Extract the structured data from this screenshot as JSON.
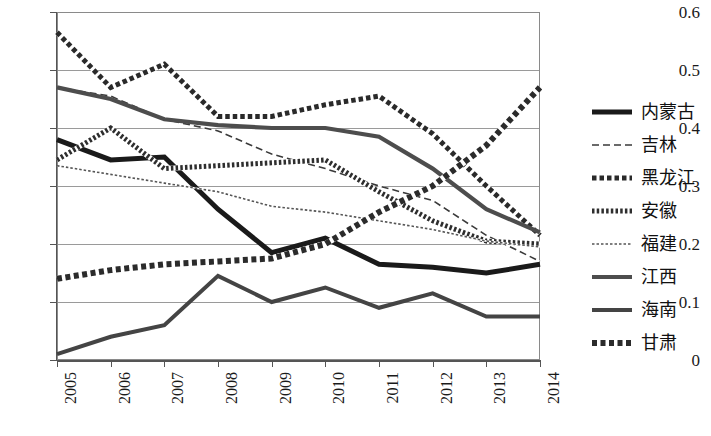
{
  "chart_data": {
    "type": "line",
    "title": "",
    "xlabel": "",
    "ylabel": "",
    "x": [
      "2005",
      "2006",
      "2007",
      "2008",
      "2009",
      "2010",
      "2011",
      "2012",
      "2013",
      "2014"
    ],
    "categories": [
      "2005",
      "2006",
      "2007",
      "2008",
      "2009",
      "2010",
      "2011",
      "2012",
      "2013",
      "2014"
    ],
    "xlim": [
      2005,
      2014
    ],
    "ylim": [
      0,
      0.6
    ],
    "yticks": [
      "0",
      "0.1",
      "0.2",
      "0.3",
      "0.4",
      "0.5",
      "0.6"
    ],
    "ytick_values": [
      0,
      0.1,
      0.2,
      0.3,
      0.4,
      0.5,
      0.6
    ],
    "grid": "horizontal",
    "legend_position": "right",
    "series": [
      {
        "name": "内蒙古",
        "style": "thick-solid-black",
        "color": "#1a1a1a",
        "values": [
          0.38,
          0.345,
          0.35,
          0.26,
          0.185,
          0.21,
          0.165,
          0.16,
          0.15,
          0.165
        ]
      },
      {
        "name": "吉林",
        "style": "thin-dashed",
        "color": "#3a3a3a",
        "values": [
          0.47,
          0.455,
          0.415,
          0.395,
          0.355,
          0.33,
          0.3,
          0.275,
          0.215,
          0.17
        ]
      },
      {
        "name": "黑龙江",
        "style": "thick-dotted",
        "color": "#2a2a2a",
        "values": [
          0.565,
          0.47,
          0.51,
          0.42,
          0.42,
          0.44,
          0.455,
          0.39,
          0.3,
          0.215
        ]
      },
      {
        "name": "安徽",
        "style": "thick-zigzag-dash",
        "color": "#2e2e2e",
        "values": [
          0.345,
          0.4,
          0.33,
          0.335,
          0.34,
          0.345,
          0.29,
          0.24,
          0.205,
          0.2
        ]
      },
      {
        "name": "福建",
        "style": "thin-zigzag",
        "color": "#555555",
        "values": [
          0.335,
          0.32,
          0.305,
          0.29,
          0.265,
          0.255,
          0.24,
          0.225,
          0.205,
          0.195
        ]
      },
      {
        "name": "江西",
        "style": "medium-solid-gray",
        "color": "#4d4d4d",
        "values": [
          0.47,
          0.45,
          0.415,
          0.405,
          0.4,
          0.4,
          0.385,
          0.33,
          0.26,
          0.22
        ]
      },
      {
        "name": "海南",
        "style": "medium-solid-dark",
        "color": "#444444",
        "values": [
          0.01,
          0.04,
          0.06,
          0.145,
          0.1,
          0.125,
          0.09,
          0.115,
          0.075,
          0.075
        ]
      },
      {
        "name": "甘肃",
        "style": "thick-hatched-dash",
        "color": "#2b2b2b",
        "values": [
          0.14,
          0.155,
          0.165,
          0.17,
          0.175,
          0.2,
          0.255,
          0.3,
          0.37,
          0.47
        ]
      }
    ]
  },
  "legend": {
    "items": [
      {
        "label": "内蒙古"
      },
      {
        "label": "吉林"
      },
      {
        "label": "黑龙江"
      },
      {
        "label": "安徽"
      },
      {
        "label": "福建"
      },
      {
        "label": "江西"
      },
      {
        "label": "海南"
      },
      {
        "label": "甘肃"
      }
    ]
  }
}
